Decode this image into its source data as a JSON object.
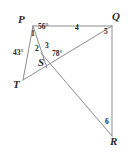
{
  "figure": {
    "background_color": "#ffffff",
    "stroke_color": "#8c8c8c",
    "label_color": "#242424",
    "width": 129,
    "height": 156
  },
  "vertices": [
    {
      "name": "P",
      "label": "P",
      "x": 29,
      "y": 20
    },
    {
      "name": "Q",
      "label": "Q",
      "x": 115,
      "y": 18
    },
    {
      "name": "T",
      "label": "T",
      "x": 15,
      "y": 72
    },
    {
      "name": "S",
      "label": "S",
      "x": 43,
      "y": 60
    },
    {
      "name": "R",
      "label": "R",
      "x": 116,
      "y": 143
    }
  ],
  "segments": [
    {
      "name": "segment-PQ",
      "from": "P",
      "to": "Q"
    },
    {
      "name": "segment-PT",
      "from": "P",
      "to": "T"
    },
    {
      "name": "segment-PS",
      "from": "P",
      "to": "S"
    },
    {
      "name": "segment-TQ",
      "from": "T",
      "to": "Q"
    },
    {
      "name": "segment-SR",
      "from": "S",
      "to": "R"
    },
    {
      "name": "segment-QR",
      "from": "Q",
      "to": "R"
    }
  ],
  "angle_labels": [
    {
      "name": "angle-1",
      "text": "1",
      "x": 32,
      "y": 30
    },
    {
      "name": "angle-56",
      "text": "56°",
      "x": 40,
      "y": 25
    },
    {
      "name": "angle-43",
      "text": "43°",
      "x": 16,
      "y": 52
    },
    {
      "name": "angle-2",
      "text": "2",
      "x": 36,
      "y": 47
    },
    {
      "name": "angle-3",
      "text": "3",
      "x": 46,
      "y": 44
    },
    {
      "name": "angle-78",
      "text": "78°",
      "x": 54,
      "y": 52
    },
    {
      "name": "angle-4",
      "text": "4",
      "x": 76,
      "y": 26
    },
    {
      "name": "angle-5",
      "text": "5",
      "x": 105,
      "y": 30
    },
    {
      "name": "angle-6",
      "text": "6",
      "x": 106,
      "y": 120
    }
  ]
}
